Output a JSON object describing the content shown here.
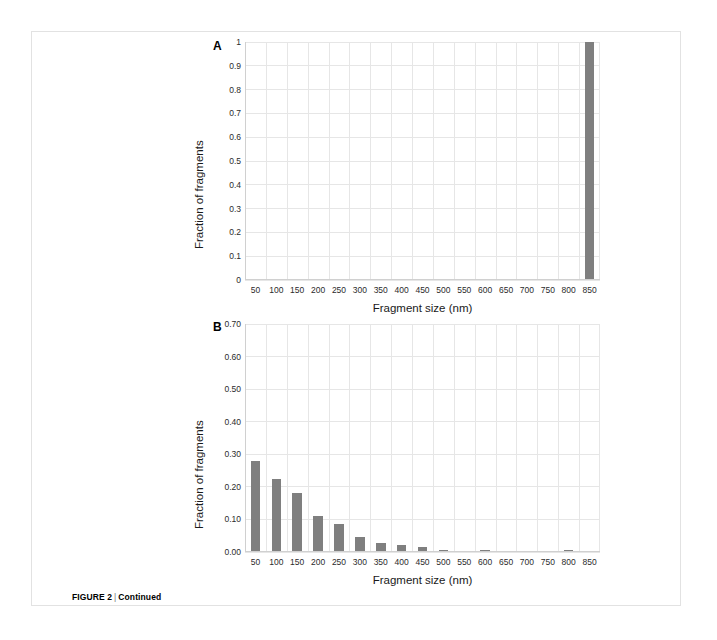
{
  "page": {
    "caption_label": "FIGURE 2",
    "caption_separator": "|",
    "caption_text": "Continued"
  },
  "chart_data": [
    {
      "id": "panel-a",
      "type": "bar",
      "panel_label": "A",
      "title": "",
      "xlabel": "Fragment size (nm)",
      "ylabel": "Fraction of fragments",
      "categories": [
        "50",
        "100",
        "150",
        "200",
        "250",
        "300",
        "350",
        "400",
        "450",
        "500",
        "550",
        "600",
        "650",
        "700",
        "750",
        "800",
        "850"
      ],
      "values": [
        0,
        0,
        0,
        0,
        0,
        0,
        0,
        0,
        0,
        0,
        0,
        0,
        0,
        0,
        0,
        0,
        1.0
      ],
      "ylim": [
        0,
        1
      ],
      "yticks": [
        "0",
        "0.1",
        "0.2",
        "0.3",
        "0.4",
        "0.5",
        "0.6",
        "0.7",
        "0.8",
        "0.9",
        "1"
      ],
      "ytick_values": [
        0,
        0.1,
        0.2,
        0.3,
        0.4,
        0.5,
        0.6,
        0.7,
        0.8,
        0.9,
        1
      ],
      "grid": true,
      "legend": "none",
      "bar_color": "#7f7f7f"
    },
    {
      "id": "panel-b",
      "type": "bar",
      "panel_label": "B",
      "title": "",
      "xlabel": "Fragment size (nm)",
      "ylabel": "Fraction of fragments",
      "categories": [
        "50",
        "100",
        "150",
        "200",
        "250",
        "300",
        "350",
        "400",
        "450",
        "500",
        "550",
        "600",
        "650",
        "700",
        "750",
        "800",
        "850"
      ],
      "values": [
        0.28,
        0.225,
        0.18,
        0.11,
        0.085,
        0.045,
        0.028,
        0.022,
        0.014,
        0.005,
        0.004,
        0.005,
        0.002,
        0.002,
        0.002,
        0.005,
        0.001
      ],
      "ylim": [
        0,
        0.7
      ],
      "yticks": [
        "0.00",
        "0.10",
        "0.20",
        "0.30",
        "0.40",
        "0.50",
        "0.60",
        "0.70"
      ],
      "ytick_values": [
        0,
        0.1,
        0.2,
        0.3,
        0.4,
        0.5,
        0.6,
        0.7
      ],
      "grid": true,
      "legend": "none",
      "bar_color": "#7f7f7f"
    }
  ]
}
